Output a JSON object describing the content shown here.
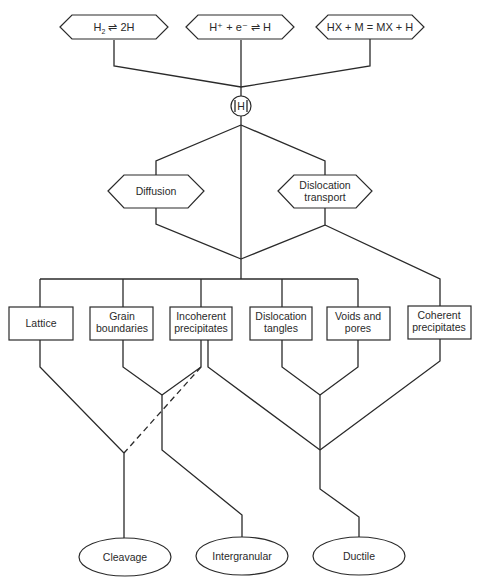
{
  "diagram": {
    "type": "flowchart",
    "sources": [
      {
        "id": "h2",
        "label_main": "H",
        "label_sub": "2",
        "label_rest": " ⇌ 2H"
      },
      {
        "id": "hplus",
        "label": "H⁺ + e⁻ ⇌ H"
      },
      {
        "id": "hx",
        "label": "HX + M = MX + H"
      }
    ],
    "central_node": {
      "label": "H"
    },
    "transport": [
      {
        "id": "diffusion",
        "lines": [
          "Diffusion"
        ]
      },
      {
        "id": "dislocation-transport",
        "lines": [
          "Dislocation",
          "transport"
        ]
      }
    ],
    "traps": [
      {
        "id": "lattice",
        "lines": [
          "Lattice"
        ]
      },
      {
        "id": "grain-boundaries",
        "lines": [
          "Grain",
          "boundaries"
        ]
      },
      {
        "id": "incoherent-precipitates",
        "lines": [
          "Incoherent",
          "precipitates"
        ]
      },
      {
        "id": "dislocation-tangles",
        "lines": [
          "Dislocation",
          "tangles"
        ]
      },
      {
        "id": "voids-and-pores",
        "lines": [
          "Voids and",
          "pores"
        ]
      },
      {
        "id": "coherent-precipitates",
        "lines": [
          "Coherent",
          "precipitates"
        ]
      }
    ],
    "fracture_modes": [
      {
        "id": "cleavage",
        "label": "Cleavage"
      },
      {
        "id": "intergranular",
        "label": "Intergranular"
      },
      {
        "id": "ductile",
        "label": "Ductile"
      }
    ],
    "edges": [
      {
        "from": "h2",
        "to": "H"
      },
      {
        "from": "hplus",
        "to": "H"
      },
      {
        "from": "hx",
        "to": "H"
      },
      {
        "from": "H",
        "to": "diffusion"
      },
      {
        "from": "H",
        "to": "dislocation-transport"
      },
      {
        "from": "H",
        "to": "traps-bus",
        "note": "direct"
      },
      {
        "from": "diffusion",
        "to": "traps-bus"
      },
      {
        "from": "dislocation-transport",
        "to": "traps-bus"
      },
      {
        "from": "dislocation-transport",
        "to": "coherent-precipitates"
      },
      {
        "from": "lattice",
        "to": "cleavage"
      },
      {
        "from": "incoherent-precipitates",
        "to": "cleavage",
        "style": "dashed"
      },
      {
        "from": "grain-boundaries",
        "to": "intergranular"
      },
      {
        "from": "incoherent-precipitates",
        "to": "intergranular"
      },
      {
        "from": "incoherent-precipitates",
        "to": "ductile"
      },
      {
        "from": "dislocation-tangles",
        "to": "ductile"
      },
      {
        "from": "voids-and-pores",
        "to": "ductile"
      },
      {
        "from": "coherent-precipitates",
        "to": "ductile"
      }
    ]
  },
  "colors": {
    "line": "#2a2a2a",
    "background": "#ffffff"
  }
}
